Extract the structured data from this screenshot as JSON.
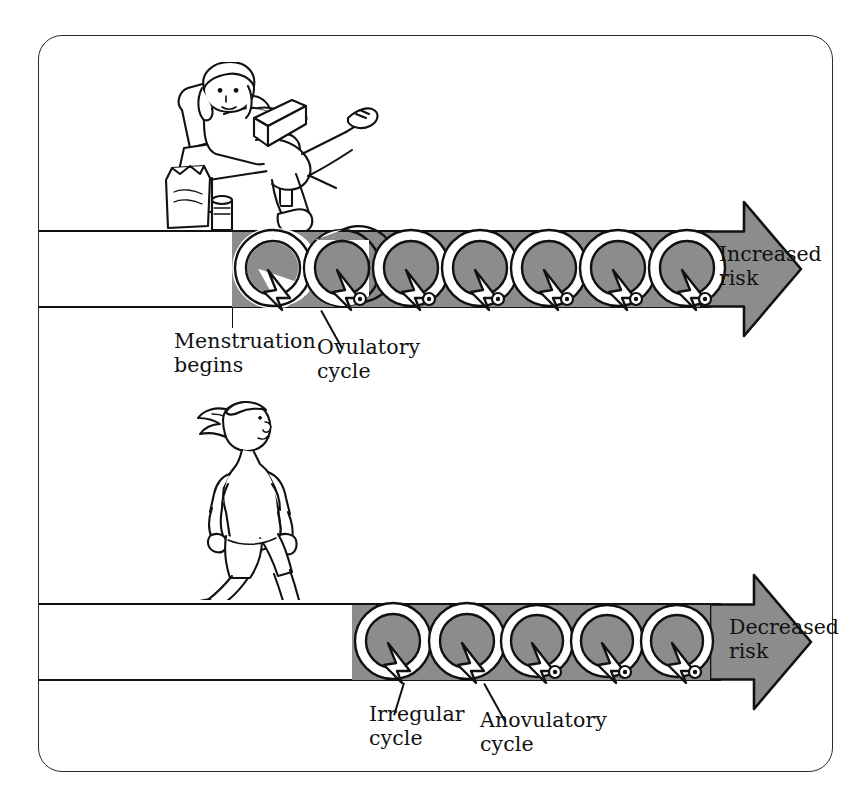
{
  "diagram": {
    "frame": {
      "border_color": "#2b2b2b"
    },
    "palette": {
      "arrow_fill": "#8c8c8c",
      "outline": "#111111",
      "loop_fill": "#ffffff",
      "background": "#ffffff"
    },
    "rows": [
      {
        "id": "sedentary",
        "figure_name": "sedentary-woman-reading-in-chair",
        "figure_description": "Woman reclining in an armchair reading a book, with a snack bag and drink on the floor",
        "arrow": {
          "name": "increased-risk-arrow",
          "direction": "right",
          "fill": "#8c8c8c",
          "cycle_count": 7,
          "cycles_with_ovum": 6
        },
        "risk_label": "Increased\nrisk",
        "annotations": [
          {
            "name": "menstruation-begins",
            "text": "Menstruation\nbegins",
            "leader": "vertical-tick"
          },
          {
            "name": "ovulatory-cycle",
            "text": "Ovulatory\ncycle",
            "leader": "diagonal"
          }
        ]
      },
      {
        "id": "athletic",
        "figure_name": "running-woman-athlete",
        "figure_description": "Woman running in shorts and t-shirt with a ponytail",
        "arrow": {
          "name": "decreased-risk-arrow",
          "direction": "right",
          "fill": "#8c8c8c",
          "cycle_count": 5,
          "cycles_with_ovum": 3
        },
        "risk_label": "Decreased\nrisk",
        "annotations": [
          {
            "name": "irregular-cycle",
            "text": "Irregular\ncycle",
            "leader": "diagonal"
          },
          {
            "name": "anovulatory-cycle",
            "text": "Anovulatory\ncycle",
            "leader": "diagonal"
          }
        ]
      }
    ]
  }
}
